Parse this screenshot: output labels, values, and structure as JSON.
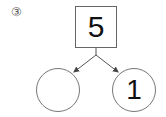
{
  "problem_label": "③",
  "number_bond": {
    "whole": "5",
    "parts": [
      {
        "position": "left",
        "value": ""
      },
      {
        "position": "right",
        "value": "1"
      }
    ]
  },
  "colors": {
    "stroke": "#555555",
    "text": "#111111"
  }
}
